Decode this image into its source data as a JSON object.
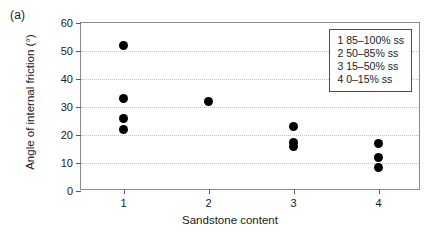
{
  "panel_label": "(a)",
  "legend": {
    "entries": [
      "1 85–100% ss",
      "2 50–85% ss",
      "3 15–50% ss",
      "4 0–15% ss"
    ]
  },
  "chart_data": {
    "type": "scatter",
    "title": "",
    "xlabel": "Sandstone content",
    "ylabel": "Angle of internal friction (°)",
    "xlim": [
      0.5,
      4.5
    ],
    "ylim": [
      0,
      60
    ],
    "xticks": [
      1,
      2,
      3,
      4
    ],
    "xtick_labels": [
      "1",
      "2",
      "3",
      "4"
    ],
    "yticks": [
      0,
      10,
      20,
      30,
      40,
      50,
      60
    ],
    "ytick_labels": [
      "0",
      "10",
      "20",
      "30",
      "40",
      "50",
      "60"
    ],
    "grid": "horizontal-dotted",
    "legend_position": "top-right-inside",
    "marker": "filled-circle",
    "marker_color": "#000000",
    "points": [
      {
        "x": 1,
        "y": 52
      },
      {
        "x": 1,
        "y": 33
      },
      {
        "x": 1,
        "y": 26
      },
      {
        "x": 1,
        "y": 22
      },
      {
        "x": 2,
        "y": 32
      },
      {
        "x": 3,
        "y": 23
      },
      {
        "x": 3,
        "y": 17.5
      },
      {
        "x": 3,
        "y": 16
      },
      {
        "x": 4,
        "y": 17
      },
      {
        "x": 4,
        "y": 12
      },
      {
        "x": 4,
        "y": 8.5
      }
    ]
  }
}
